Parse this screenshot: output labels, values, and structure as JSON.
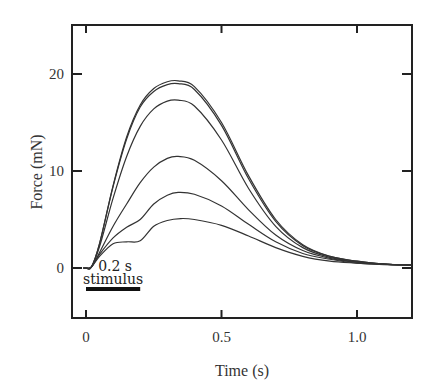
{
  "chart_data": {
    "type": "line",
    "title": "",
    "xlabel": "Time (s)",
    "ylabel": "Force (mN)",
    "xlim": [
      -0.05,
      1.2
    ],
    "ylim": [
      -5,
      25
    ],
    "xticks": [
      0,
      0.5,
      1.0
    ],
    "xtick_labels": [
      "0",
      "0.5",
      "1.0"
    ],
    "yticks": [
      0,
      10,
      20
    ],
    "ytick_labels": [
      "0",
      "10",
      "20"
    ],
    "grid": false,
    "legend": null,
    "annotations": [
      {
        "text": "0.2 s",
        "x": 0.1,
        "y": -0.5
      },
      {
        "text": "stimulus",
        "x": 0.1,
        "y": -2.0
      }
    ],
    "stimulus_bar": {
      "x_start": 0.0,
      "x_end": 0.2,
      "y": -2.3
    },
    "series": [
      {
        "name": "trace 1",
        "peak_time": 0.34,
        "peak": 19.3,
        "x": [
          0,
          0.02,
          0.05,
          0.1,
          0.15,
          0.2,
          0.25,
          0.3,
          0.34,
          0.4,
          0.5,
          0.6,
          0.7,
          0.8,
          0.9,
          1.0,
          1.1,
          1.2
        ],
        "values": [
          0,
          0.1,
          2.5,
          8.5,
          13.5,
          16.8,
          18.5,
          19.2,
          19.3,
          18.7,
          15.0,
          9.5,
          5.0,
          2.4,
          1.2,
          0.7,
          0.4,
          0.3
        ]
      },
      {
        "name": "trace 2",
        "peak_time": 0.34,
        "peak": 19.0,
        "x": [
          0,
          0.02,
          0.05,
          0.1,
          0.15,
          0.2,
          0.25,
          0.3,
          0.34,
          0.4,
          0.5,
          0.6,
          0.7,
          0.8,
          0.9,
          1.0,
          1.1,
          1.2
        ],
        "values": [
          0,
          0.1,
          2.5,
          8.4,
          13.3,
          16.6,
          18.2,
          18.9,
          19.0,
          18.4,
          14.7,
          9.2,
          4.8,
          2.3,
          1.2,
          0.7,
          0.4,
          0.3
        ]
      },
      {
        "name": "trace 3",
        "peak_time": 0.34,
        "peak": 17.3,
        "x": [
          0,
          0.02,
          0.05,
          0.1,
          0.15,
          0.2,
          0.25,
          0.3,
          0.34,
          0.4,
          0.5,
          0.6,
          0.7,
          0.8,
          0.9,
          1.0,
          1.1,
          1.2
        ],
        "values": [
          0,
          0.1,
          2.2,
          7.2,
          11.5,
          14.6,
          16.4,
          17.2,
          17.3,
          16.7,
          13.2,
          8.2,
          4.3,
          2.1,
          1.1,
          0.6,
          0.4,
          0.3
        ]
      },
      {
        "name": "trace 4",
        "peak_time": 0.34,
        "peak": 11.5,
        "x": [
          0,
          0.02,
          0.05,
          0.1,
          0.15,
          0.2,
          0.25,
          0.3,
          0.34,
          0.4,
          0.5,
          0.6,
          0.7,
          0.8,
          0.9,
          1.0,
          1.1,
          1.2
        ],
        "values": [
          0,
          0.1,
          1.6,
          4.3,
          6.6,
          8.8,
          10.4,
          11.3,
          11.5,
          11.1,
          9.0,
          6.0,
          3.4,
          1.8,
          1.0,
          0.6,
          0.4,
          0.3
        ]
      },
      {
        "name": "trace 5",
        "peak_time": 0.34,
        "peak": 7.8,
        "x": [
          0,
          0.02,
          0.05,
          0.1,
          0.15,
          0.2,
          0.25,
          0.3,
          0.34,
          0.4,
          0.5,
          0.6,
          0.7,
          0.8,
          0.9,
          1.0,
          1.1,
          1.2
        ],
        "values": [
          0,
          0.1,
          1.4,
          3.1,
          4.2,
          5.0,
          6.6,
          7.5,
          7.8,
          7.6,
          6.4,
          4.5,
          2.7,
          1.5,
          0.9,
          0.5,
          0.4,
          0.3
        ]
      },
      {
        "name": "trace 6",
        "peak_time": 0.35,
        "peak": 5.1,
        "x": [
          0,
          0.02,
          0.05,
          0.1,
          0.15,
          0.2,
          0.25,
          0.3,
          0.35,
          0.4,
          0.5,
          0.6,
          0.7,
          0.8,
          0.9,
          1.0,
          1.1,
          1.2
        ],
        "values": [
          0,
          0.1,
          1.2,
          2.5,
          2.7,
          2.8,
          4.3,
          4.9,
          5.1,
          5.0,
          4.4,
          3.3,
          2.1,
          1.2,
          0.7,
          0.5,
          0.35,
          0.3
        ]
      }
    ]
  },
  "colors": {
    "line": "#333333",
    "axis": "#222222",
    "background": "#ffffff"
  }
}
